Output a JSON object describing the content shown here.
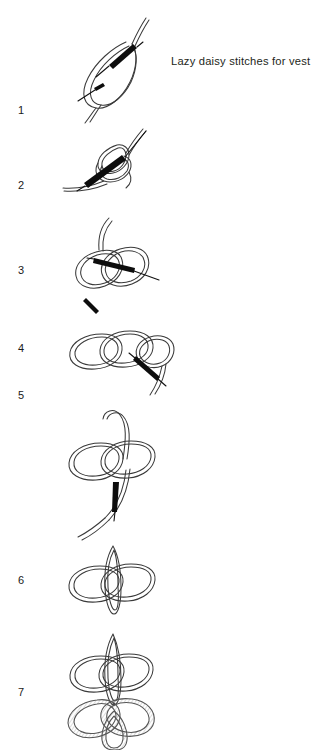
{
  "page": {
    "title": "Lazy daisy stitches for vest",
    "background_color": "#ffffff",
    "ink_color": "#231f20",
    "width": 317,
    "height": 750
  },
  "caption": {
    "text": "Lazy daisy stitches for vest"
  },
  "steps": [
    {
      "number": "1",
      "description": "Needle pulled up through fabric forming a single thread loop; needle re-enters beside the starting point and emerges at the loop tip."
    },
    {
      "number": "2",
      "description": "Thread loop twisted into a figure-eight as the needle is drawn through from below, tightening the first petal."
    },
    {
      "number": "3",
      "description": "First petal anchored; second loop laid beside it with the needle passing horizontally through both loops."
    },
    {
      "number": "4",
      "description": "Two completed petals with a third loop being formed at the right as the needle passes down through the fabric."
    },
    {
      "number": "5",
      "description": "Three petals joined at a common center with a long working thread curving down to the needle."
    },
    {
      "number": "6",
      "description": "Three finished petals: two side loops and one upright center loop radiating from the shared center point."
    },
    {
      "number": "7",
      "description": "Completed lazy daisy flower of six petals: three plain upper petals and three textured lower petals."
    }
  ],
  "icons": {
    "needle": "sewing-needle-icon",
    "thread_loop": "thread-loop-icon",
    "petal": "petal-icon"
  }
}
